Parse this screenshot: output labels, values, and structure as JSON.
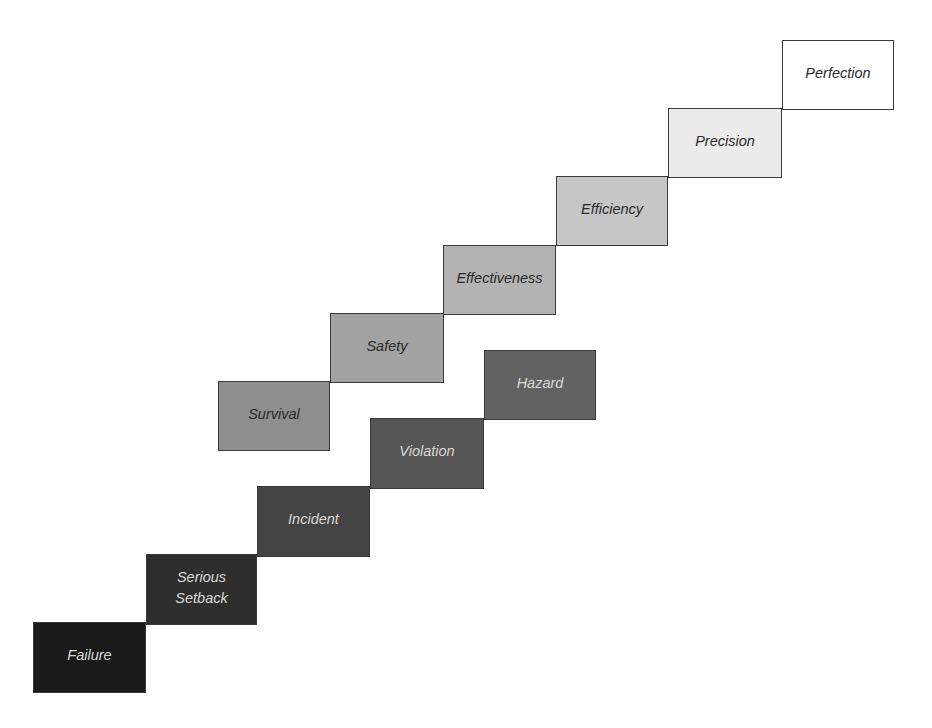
{
  "diagram": {
    "type": "staircase",
    "upper_staircase": [
      {
        "label": "Survival",
        "fill": "#8e8e8e",
        "text_color": "#2a2a2a",
        "x": 218,
        "y": 381,
        "w": 112,
        "h": 70
      },
      {
        "label": "Safety",
        "fill": "#a2a2a2",
        "text_color": "#2a2a2a",
        "x": 330,
        "y": 313,
        "w": 114,
        "h": 70
      },
      {
        "label": "Effectiveness",
        "fill": "#b3b3b3",
        "text_color": "#2a2a2a",
        "x": 443,
        "y": 245,
        "w": 113,
        "h": 70
      },
      {
        "label": "Efficiency",
        "fill": "#c6c6c6",
        "text_color": "#2a2a2a",
        "x": 556,
        "y": 176,
        "w": 112,
        "h": 70
      },
      {
        "label": "Precision",
        "fill": "#ececec",
        "text_color": "#2a2a2a",
        "x": 668,
        "y": 108,
        "w": 114,
        "h": 70
      },
      {
        "label": "Perfection",
        "fill": "#ffffff",
        "text_color": "#2a2a2a",
        "x": 782,
        "y": 40,
        "w": 112,
        "h": 70
      }
    ],
    "lower_staircase": [
      {
        "label": "Failure",
        "fill": "#1a1a1a",
        "text_color": "#d8d8d8",
        "x": 33,
        "y": 622,
        "w": 113,
        "h": 71
      },
      {
        "label": "Serious\nSetback",
        "fill": "#2e2e2e",
        "text_color": "#d8d8d8",
        "x": 146,
        "y": 554,
        "w": 111,
        "h": 71
      },
      {
        "label": "Incident",
        "fill": "#444444",
        "text_color": "#d8d8d8",
        "x": 257,
        "y": 486,
        "w": 113,
        "h": 71
      },
      {
        "label": "Violation",
        "fill": "#555555",
        "text_color": "#d8d8d8",
        "x": 370,
        "y": 418,
        "w": 114,
        "h": 71
      },
      {
        "label": "Hazard",
        "fill": "#626262",
        "text_color": "#d8d8d8",
        "x": 484,
        "y": 350,
        "w": 112,
        "h": 70
      }
    ]
  }
}
